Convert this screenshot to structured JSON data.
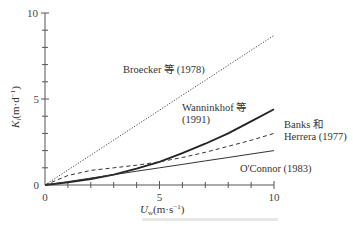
{
  "chart_data": {
    "type": "line",
    "title": "",
    "xlabel": "U_w (m·s⁻¹)",
    "ylabel": "K_l (m·d⁻¹)",
    "xlim": [
      0,
      10
    ],
    "ylim": [
      0,
      10
    ],
    "x_ticks": [
      0,
      5,
      10
    ],
    "y_ticks": [
      0,
      5,
      10
    ],
    "x_minor_step": 1,
    "y_minor_step": 1,
    "grid": false,
    "legend": "inline labels",
    "x": [
      0,
      1,
      2,
      3,
      4,
      5,
      6,
      7,
      8,
      9,
      10
    ],
    "series": [
      {
        "name": "Broecker 等 (1978)",
        "style": "dotted",
        "values": [
          0,
          0.87,
          1.74,
          2.61,
          3.48,
          4.35,
          5.22,
          6.09,
          6.96,
          7.83,
          8.7
        ]
      },
      {
        "name": "Wanninkhof 等 (1991)",
        "style": "solid-thick",
        "values": [
          0,
          0.15,
          0.35,
          0.6,
          0.95,
          1.35,
          1.85,
          2.4,
          3.0,
          3.7,
          4.4
        ]
      },
      {
        "name": "Banks 和 Herrera (1977)",
        "style": "dashed",
        "values": [
          0,
          0.55,
          0.85,
          1.0,
          1.15,
          1.35,
          1.6,
          1.9,
          2.25,
          2.6,
          3.0
        ]
      },
      {
        "name": "O'Connor (1983)",
        "style": "solid-thin",
        "values": [
          0,
          0.2,
          0.4,
          0.6,
          0.8,
          1.0,
          1.2,
          1.4,
          1.6,
          1.8,
          2.0
        ]
      }
    ]
  },
  "labels": {
    "broecker": "Broecker 等 (1978)",
    "wanninkhof_1": "Wanninkhof 等",
    "wanninkhof_2": "(1991)",
    "banks_1": "Banks 和",
    "banks_2": "Herrera (1977)",
    "oconnor": "O'Connor (1983)",
    "x_axis": "U",
    "x_axis_sub": "w",
    "x_axis_unit": "(m·s",
    "x_axis_exp": "−1",
    "x_axis_close": ")",
    "y_axis": "K",
    "y_axis_sub": "l",
    "y_axis_unit": "(m·d",
    "y_axis_exp": "−1",
    "y_axis_close": ")",
    "x_tick_0": "0",
    "x_tick_5": "5",
    "x_tick_10": "10",
    "y_tick_0": "0",
    "y_tick_5": "5",
    "y_tick_10": "10"
  }
}
